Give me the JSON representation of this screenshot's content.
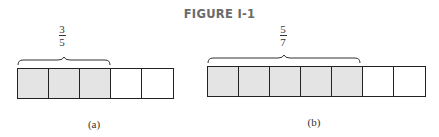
{
  "title": "FIGURE I-1",
  "panels": [
    {
      "label": "(a)",
      "fraction": {
        "numerator": "3",
        "denominator": "5"
      },
      "total_cells": 5,
      "shaded_cells": 3
    },
    {
      "label": "(b)",
      "fraction": {
        "numerator": "5",
        "denominator": "7"
      },
      "total_cells": 7,
      "shaded_cells": 5
    }
  ],
  "colors": {
    "shaded": "#e4e4e4",
    "unshaded": "#ffffff",
    "outline": "#222222"
  }
}
